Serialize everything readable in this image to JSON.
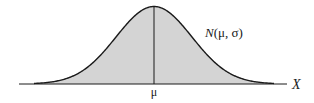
{
  "diagram": {
    "type": "normal-distribution-curve",
    "curve_label": "N(μ, σ)",
    "curve_label_parts": {
      "n": "N",
      "args": "(μ, σ)"
    },
    "axis_label": "X",
    "mean_label": "μ",
    "colors": {
      "fill": "#d4d4d4",
      "stroke": "#1a1a1a",
      "background": "#ffffff"
    }
  }
}
